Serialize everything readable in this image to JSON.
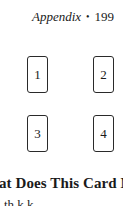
{
  "running_head": {
    "title": "Appendix",
    "separator": "•",
    "page_number": "199"
  },
  "spread": {
    "cards": [
      {
        "position": "1"
      },
      {
        "position": "2"
      },
      {
        "position": "3"
      },
      {
        "position": "4"
      }
    ]
  },
  "section": {
    "heading": "at Does This Card Mean",
    "partial_line": "th  k                    k  "
  }
}
